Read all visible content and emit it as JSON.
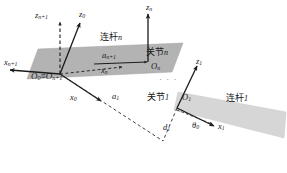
{
  "figure": {
    "background_color": "#ffffff",
    "width": 287,
    "height": 173,
    "line_color": "#1a1a1a",
    "link_n_fill": "#b3b3b3",
    "link_1_fill": "#d4d4d4"
  },
  "links": [
    {
      "id": "link-n",
      "label": "连杆",
      "index": "n",
      "fill": "#b3b3b3",
      "points": "38,49 183,43 172,72 27,79"
    },
    {
      "id": "link-1",
      "label": "连杆",
      "index": "1",
      "fill": "#d4d4d4",
      "points": "176,94 285,113 283,137 173,111"
    }
  ],
  "joints": [
    {
      "id": "joint-n",
      "label": "关节",
      "index": "n"
    },
    {
      "id": "joint-1",
      "label": "关节",
      "index": "1"
    }
  ],
  "frames": {
    "origin_0_n1": {
      "label": "O",
      "sub": "0",
      "equals": "≡",
      "label2": "O",
      "sub2": "n+1"
    },
    "origin_n": {
      "label": "O",
      "sub": "n"
    },
    "origin_1": {
      "label": "O",
      "sub": "1"
    }
  },
  "axis_labels": [
    {
      "name": "z-n-plus-1",
      "base": "z",
      "sub": "n+1",
      "x": 38,
      "y": 15
    },
    {
      "name": "z-0",
      "base": "z",
      "sub": "0",
      "x": 79,
      "y": 13
    },
    {
      "name": "z-n",
      "base": "z",
      "sub": "n",
      "x": 145,
      "y": 5
    },
    {
      "name": "x-n-plus-1",
      "base": "x",
      "sub": "n+1",
      "x": 6,
      "y": 61
    },
    {
      "name": "x-n",
      "base": "x",
      "sub": "n",
      "x": 101,
      "y": 68
    },
    {
      "name": "x-0",
      "base": "x",
      "sub": "0",
      "x": 72,
      "y": 95
    },
    {
      "name": "z-1",
      "base": "z",
      "sub": "1",
      "x": 196,
      "y": 60
    },
    {
      "name": "x-1",
      "base": "x",
      "sub": "1",
      "x": 218,
      "y": 125
    }
  ],
  "dimension_labels": [
    {
      "name": "a-n-plus-1",
      "base": "a",
      "sub": "n+1",
      "x": 104,
      "y": 55
    },
    {
      "name": "a-1",
      "base": "a",
      "sub": "1",
      "x": 112,
      "y": 95
    },
    {
      "name": "d-1",
      "base": "d",
      "sub": "1",
      "x": 163,
      "y": 126
    },
    {
      "name": "theta-0",
      "base": "θ",
      "sub": "0",
      "x": 194,
      "y": 124
    }
  ],
  "origin_labels": {
    "o0_on1": {
      "x": 32,
      "y": 72,
      "text": "O₀≡On+1"
    },
    "on": {
      "x": 152,
      "y": 64
    },
    "o1": {
      "x": 183,
      "y": 95
    }
  },
  "text_blocks": {
    "link_n_text": {
      "x": 100,
      "y": 36
    },
    "link_1_text": {
      "x": 230,
      "y": 97
    },
    "joint_n_text": {
      "x": 147,
      "y": 51
    },
    "joint_1_text": {
      "x": 149,
      "y": 96
    },
    "ellipsis": {
      "x": 160,
      "y": 78,
      "text": "· · ·"
    }
  }
}
